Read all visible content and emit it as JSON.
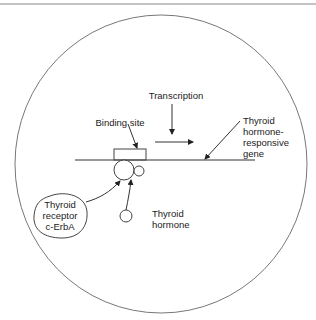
{
  "diagram": {
    "labels": {
      "transcription": "Transcription",
      "binding_site": "Binding site",
      "gene_line1": "Thyroid",
      "gene_line2": "hormone-",
      "gene_line3": "responsive",
      "gene_line4": "gene",
      "receptor_line1": "Thyroid",
      "receptor_line2": "receptor",
      "receptor_line3": "c-ErbA",
      "hormone_line1": "Thyroid",
      "hormone_line2": "hormone"
    },
    "colors": {
      "stroke": "#555555",
      "text": "#222222",
      "top_rule": "#888888"
    }
  }
}
